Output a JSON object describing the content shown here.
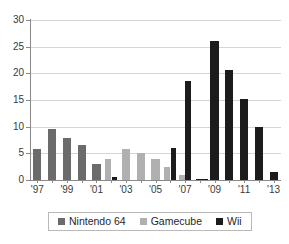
{
  "chart_data": {
    "type": "bar",
    "title": "",
    "subtitle": "",
    "xlabel": "",
    "ylabel": "",
    "ylim": [
      0,
      30
    ],
    "yticks": [
      0,
      5,
      10,
      15,
      20,
      25,
      30
    ],
    "ytick_labels": [
      "0",
      "5",
      "10",
      "15",
      "20",
      "25",
      "30"
    ],
    "grid": true,
    "legend_position": "bottom",
    "categories": [
      "1997",
      "1998",
      "1999",
      "2000",
      "2001",
      "2002",
      "2003",
      "2004",
      "2005",
      "2006",
      "2007",
      "2008",
      "2009",
      "2010",
      "2011",
      "2012",
      "2013"
    ],
    "xtick_labels": [
      "'97",
      "'99",
      "'01",
      "'03",
      "'05",
      "'07",
      "'09",
      "'11",
      "'13"
    ],
    "xtick_categories": [
      "1997",
      "1999",
      "2001",
      "2003",
      "2005",
      "2007",
      "2009",
      "2011",
      "2013"
    ],
    "series": [
      {
        "name": "Nintendo 64",
        "color": "#6b6b6b",
        "values": [
          5.9,
          9.5,
          7.9,
          6.5,
          3.0,
          null,
          null,
          null,
          null,
          null,
          null,
          null,
          null,
          null,
          null,
          null,
          null
        ]
      },
      {
        "name": "Gamecube",
        "color": "#b0b0b0",
        "values": [
          null,
          null,
          null,
          null,
          null,
          3.9,
          5.8,
          5.1,
          4.0,
          2.5,
          0.9,
          null,
          null,
          null,
          null,
          null,
          null
        ]
      },
      {
        "name": "Wii",
        "color": "#1c1c1c",
        "values": [
          null,
          null,
          null,
          null,
          null,
          0.6,
          null,
          null,
          null,
          6.0,
          18.6,
          0.25,
          26.0,
          20.7,
          15.2,
          9.9,
          1.5
        ]
      }
    ],
    "bars": [
      {
        "category": "1997",
        "series": "Nintendo 64",
        "value": 5.9
      },
      {
        "category": "1998",
        "series": "Nintendo 64",
        "value": 9.5
      },
      {
        "category": "1999",
        "series": "Nintendo 64",
        "value": 7.9
      },
      {
        "category": "2000",
        "series": "Nintendo 64",
        "value": 6.5
      },
      {
        "category": "2001",
        "series": "Nintendo 64",
        "value": 3.0
      },
      {
        "category": "2002",
        "series": "Gamecube",
        "value": 3.9
      },
      {
        "category": "2002",
        "series": "Wii",
        "value": 0.6
      },
      {
        "category": "2003",
        "series": "Gamecube",
        "value": 5.8
      },
      {
        "category": "2004",
        "series": "Gamecube",
        "value": 5.1
      },
      {
        "category": "2005",
        "series": "Gamecube",
        "value": 4.0
      },
      {
        "category": "2006",
        "series": "Gamecube",
        "value": 2.5
      },
      {
        "category": "2007",
        "series": "Wii",
        "value": 6.0
      },
      {
        "category": "2007",
        "series": "Gamecube",
        "value": 0.9
      },
      {
        "category": "2008",
        "series": "Wii",
        "value": 18.6
      },
      {
        "category": "2008",
        "series": "Wii_small",
        "value": 0.25
      },
      {
        "category": "2009",
        "series": "Wii",
        "value": 26.0
      },
      {
        "category": "2010",
        "series": "Wii",
        "value": 20.7
      },
      {
        "category": "2011",
        "series": "Wii",
        "value": 15.2
      },
      {
        "category": "2012",
        "series": "Wii",
        "value": 9.9
      },
      {
        "category": "2013",
        "series": "Wii",
        "value": 1.5
      }
    ],
    "legend": [
      {
        "label": "Nintendo 64",
        "color": "#6b6b6b"
      },
      {
        "label": "Gamecube",
        "color": "#b0b0b0"
      },
      {
        "label": "Wii",
        "color": "#1c1c1c"
      }
    ]
  }
}
